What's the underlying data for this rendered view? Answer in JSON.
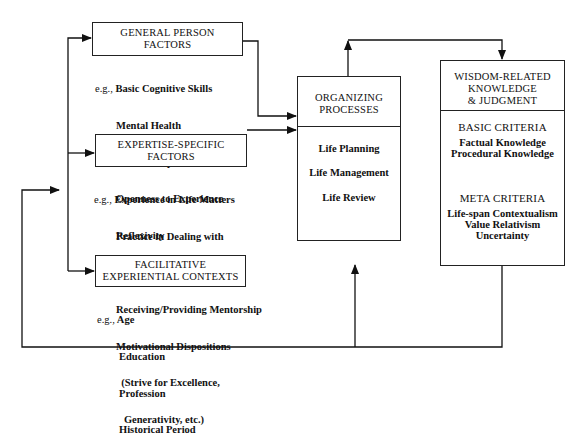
{
  "diagram": {
    "general_person": {
      "title_line1": "GENERAL PERSON",
      "title_line2": "FACTORS",
      "eg": "e.g.,",
      "items": [
        "Basic Cognitive Skills",
        "Mental Health",
        "Social Competence",
        "Openness to Experience",
        "Reflexivity"
      ]
    },
    "expertise_specific": {
      "title_line1": "EXPERTISE-SPECIFIC",
      "title_line2": "FACTORS",
      "eg": "e.g.,",
      "items": [
        "Experience in Life Matters",
        "Practice in Dealing with",
        "  Life Problems",
        "Receiving/Providing Mentorship",
        "Motivational Dispositions",
        "  (Strive for Excellence,",
        "   Generativity, etc.)"
      ]
    },
    "facilitative": {
      "title_line1": "FACILITATIVE",
      "title_line2": "EXPERIENTIAL CONTEXTS",
      "eg": "e.g.,",
      "items": [
        "Age",
        "Education",
        "Profession",
        "Historical Period"
      ]
    },
    "organizing": {
      "title_line1": "ORGANIZING",
      "title_line2": "PROCESSES",
      "items": [
        "Life Planning",
        "Life Management",
        "Life Review"
      ]
    },
    "wisdom": {
      "title_line1": "WISDOM-RELATED",
      "title_line2": "KNOWLEDGE",
      "title_line3": "& JUDGMENT",
      "basic_title": "BASIC CRITERIA",
      "basic_items": [
        "Factual Knowledge",
        "Procedural Knowledge"
      ],
      "meta_title": "META CRITERIA",
      "meta_items": [
        "Life-span Contextualism",
        "Value Relativism",
        "Uncertainty"
      ]
    }
  }
}
